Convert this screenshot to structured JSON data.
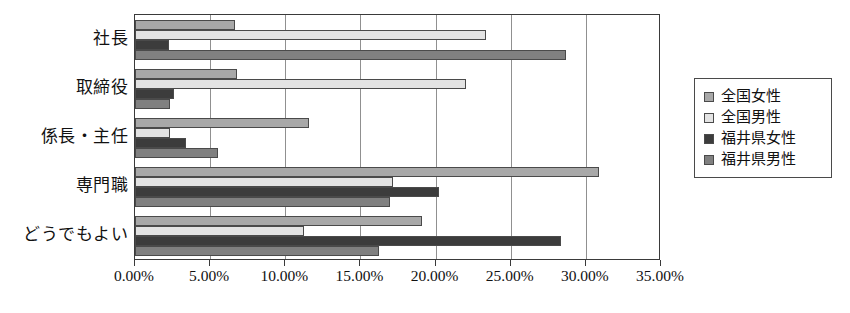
{
  "chart_data": {
    "type": "bar",
    "orientation": "horizontal",
    "title": "",
    "subtitle": "",
    "xlabel": "",
    "ylabel": "",
    "xlim": [
      0,
      35
    ],
    "xtick_labels": [
      "0.00%",
      "5.00%",
      "10.00%",
      "15.00%",
      "20.00%",
      "25.00%",
      "30.00%",
      "35.00%"
    ],
    "xticks": [
      0,
      5,
      10,
      15,
      20,
      25,
      30,
      35
    ],
    "grid": "vertical",
    "legend_position": "right",
    "categories": [
      "社長",
      "取締役",
      "係長・主任",
      "専門職",
      "どうでもよい"
    ],
    "series": [
      {
        "name": "全国女性",
        "color": "#a8a8a8",
        "values": [
          6.65,
          6.8,
          11.55,
          30.9,
          19.1
        ]
      },
      {
        "name": "全国男性",
        "color": "#e3e3e3",
        "values": [
          23.35,
          22.0,
          2.3,
          17.2,
          11.25
        ]
      },
      {
        "name": "福井県女性",
        "color": "#3c3c3c",
        "values": [
          2.25,
          2.6,
          3.4,
          20.2,
          28.35
        ]
      },
      {
        "name": "福井県男性",
        "color": "#808080",
        "values": [
          28.7,
          2.3,
          5.55,
          17.0,
          16.25
        ]
      }
    ]
  },
  "legend": {
    "items": [
      {
        "label": "全国女性",
        "swatch": "#a8a8a8"
      },
      {
        "label": "全国男性",
        "swatch": "#e3e3e3"
      },
      {
        "label": "福井県女性",
        "swatch": "#3c3c3c"
      },
      {
        "label": "福井県男性",
        "swatch": "#808080"
      }
    ]
  }
}
